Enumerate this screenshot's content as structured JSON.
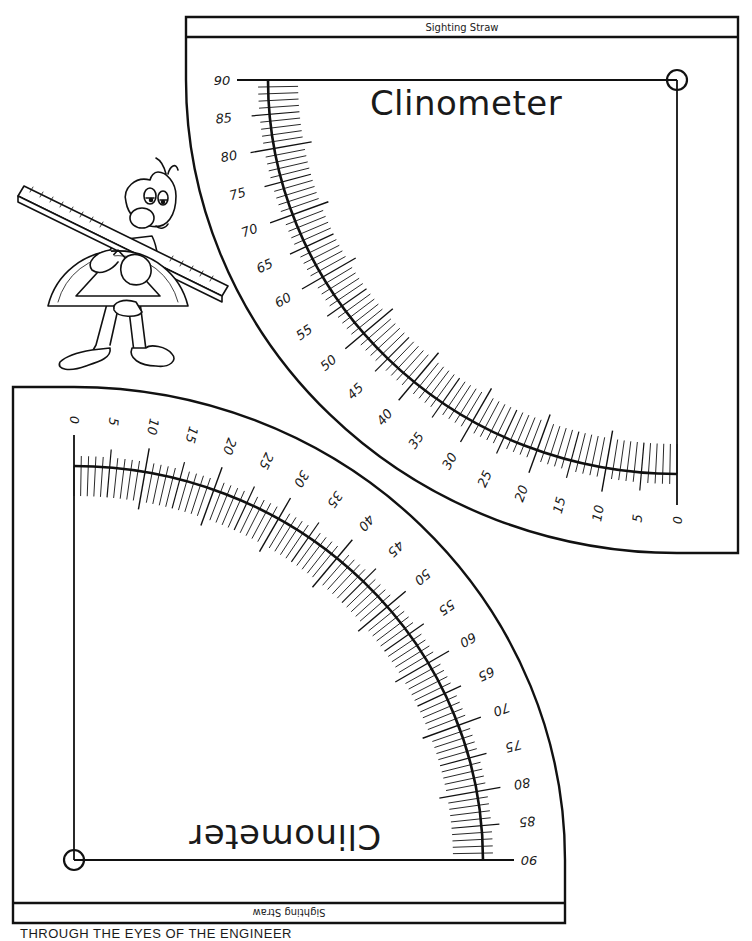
{
  "page": {
    "background": "#ffffff",
    "ink_color": "#111111",
    "footer_text": "THROUGH THE EYES OF THE ENGINEER"
  },
  "clinometers": [
    {
      "id": "top",
      "orientation": "upright",
      "title": "Clinometer",
      "band_label": "Sighting Straw",
      "scale": {
        "start_deg": 0,
        "end_deg": 90,
        "minor_step": 1,
        "medium_step": 5,
        "major_step": 10,
        "labels": [
          "0",
          "5",
          "10",
          "15",
          "20",
          "25",
          "30",
          "35",
          "40",
          "45",
          "50",
          "55",
          "60",
          "65",
          "70",
          "75",
          "80",
          "85",
          "90"
        ]
      },
      "pivot_marker": "pivot-circle"
    },
    {
      "id": "bottom",
      "orientation": "rotated-180",
      "title": "Clinometer",
      "band_label": "Sighting Straw",
      "scale": {
        "start_deg": 0,
        "end_deg": 90,
        "minor_step": 1,
        "medium_step": 5,
        "major_step": 10,
        "labels": [
          "0",
          "5",
          "10",
          "15",
          "20",
          "25",
          "30",
          "35",
          "40",
          "45",
          "50",
          "55",
          "60",
          "65",
          "70",
          "75",
          "80",
          "85",
          "90"
        ]
      },
      "pivot_marker": "pivot-circle"
    }
  ],
  "illustration": {
    "description": "cartoon character holding a ruler and a protractor",
    "items": [
      "ruler",
      "protractor",
      "character"
    ]
  }
}
